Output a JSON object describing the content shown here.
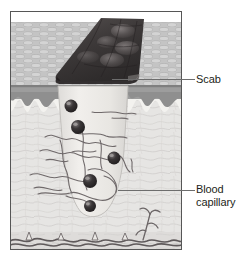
{
  "figure": {
    "frame": {
      "x": 10,
      "y": 11,
      "width": 172,
      "height": 239,
      "border_color": "#555555",
      "background_color": "#ffffff"
    },
    "layers": [
      {
        "name": "epidermis",
        "label": "epidermis",
        "y_top": 22,
        "y_bottom": 86,
        "fill": "#b9b9b9",
        "texture": "woven-scale"
      },
      {
        "name": "basal-band",
        "label": "basal layer band",
        "y_top": 86,
        "y_bottom": 98,
        "fill": "#9a9a9a"
      },
      {
        "name": "dermis",
        "label": "dermis",
        "y_top": 98,
        "y_bottom": 232,
        "fill": "#e3e3e1",
        "texture": "fibrous"
      },
      {
        "name": "subcutaneous-plexus",
        "label": "deep vascular plexus",
        "y_top": 232,
        "y_bottom": 250,
        "fill": "#dcdcda"
      }
    ],
    "scab": {
      "name": "scab",
      "fill_dark": "#3c3a3b",
      "fill_light": "#6e6a6b",
      "bumps": 5
    },
    "wound_channel": {
      "name": "wound-channel",
      "fill": "#ededea",
      "top_left_x": 58,
      "top_right_x": 128,
      "bottom_y": 216
    },
    "blood_cells": [
      {
        "cx": 71,
        "cy": 106,
        "r": 6.5
      },
      {
        "cx": 78,
        "cy": 127,
        "r": 7.0
      },
      {
        "cx": 114,
        "cy": 158,
        "r": 6.5
      },
      {
        "cx": 90,
        "cy": 181,
        "r": 7.0
      },
      {
        "cx": 90,
        "cy": 206,
        "r": 6.0
      }
    ],
    "blood_cell_color": "#2b2829",
    "capillary_color": "#6b6566"
  },
  "callouts": [
    {
      "id": "scab",
      "label": "Scab",
      "lines": [
        "Scab"
      ],
      "leader": {
        "x1": 112,
        "y1": 79,
        "x2": 194,
        "y2": 79
      },
      "text_x": 196,
      "text_y": 73
    },
    {
      "id": "blood-capillary",
      "label": "Blood capillary",
      "lines": [
        "Blood",
        "capillary"
      ],
      "leader": {
        "x1": 118,
        "y1": 190,
        "x2": 194,
        "y2": 190
      },
      "text_x": 196,
      "text_y": 183
    }
  ],
  "colors": {
    "text": "#231f20",
    "leader_line": "#6d6d6d",
    "frame_border": "#555555",
    "page_background": "#ffffff"
  }
}
